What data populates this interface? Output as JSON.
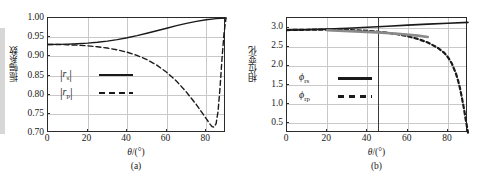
{
  "figure": {
    "panels": [
      {
        "id": "a",
        "caption": "(a)",
        "xlabel_symbol": "θ",
        "xlabel_unit": "/(°)",
        "ylabel": "振幅系数",
        "legend": [
          {
            "key": "|r",
            "sub": "s",
            "key_end": "|",
            "style": "solid",
            "name": "rs"
          },
          {
            "key": "|r",
            "sub": "p",
            "key_end": "|",
            "style": "dashed",
            "name": "rp"
          }
        ]
      },
      {
        "id": "b",
        "caption": "(b)",
        "xlabel_symbol": "θ",
        "xlabel_unit": "/(°)",
        "ylabel": "相位变化",
        "legend": [
          {
            "key": "ϕ",
            "sub": "rs",
            "key_end": "",
            "style": "solid",
            "name": "phi-rs"
          },
          {
            "key": "ϕ",
            "sub": "rp",
            "key_end": "",
            "style": "dashed",
            "name": "phi-rp"
          }
        ]
      }
    ]
  },
  "chart_data": [
    {
      "type": "line",
      "panel": "a",
      "title": "",
      "xlabel": "θ/(°)",
      "ylabel": "振幅系数",
      "xlim": [
        0,
        90
      ],
      "ylim": [
        0.7,
        1.0
      ],
      "xticks": [
        0,
        20,
        40,
        60,
        80
      ],
      "yticks": [
        0.7,
        0.75,
        0.8,
        0.85,
        0.9,
        0.95,
        1.0
      ],
      "ytick_labels": [
        "0.70",
        "0.75",
        "0.80",
        "0.85",
        "0.90",
        "0.95",
        "1.00"
      ],
      "xtick_labels": [
        "0",
        "20",
        "40",
        "60",
        "80"
      ],
      "grid": true,
      "legend_position": "center-left",
      "series": [
        {
          "name": "|r_s|",
          "style": "solid",
          "color": "#1a1a1a",
          "x": [
            0,
            5,
            10,
            15,
            20,
            25,
            30,
            35,
            40,
            45,
            50,
            55,
            60,
            65,
            70,
            75,
            80,
            85,
            90
          ],
          "y": [
            0.931,
            0.9312,
            0.9318,
            0.9329,
            0.9345,
            0.9368,
            0.9398,
            0.9437,
            0.9484,
            0.9539,
            0.9601,
            0.9667,
            0.9734,
            0.98,
            0.986,
            0.9912,
            0.9953,
            0.9984,
            1.0
          ]
        },
        {
          "name": "|r_p|",
          "style": "dashed",
          "color": "#1a1a1a",
          "x": [
            0,
            5,
            10,
            15,
            20,
            25,
            30,
            35,
            40,
            45,
            50,
            55,
            60,
            65,
            70,
            75,
            80,
            82,
            83,
            84,
            85,
            86,
            87,
            88,
            89,
            90
          ],
          "y": [
            0.931,
            0.9308,
            0.9302,
            0.9291,
            0.9274,
            0.925,
            0.9216,
            0.917,
            0.9108,
            0.9024,
            0.8914,
            0.877,
            0.8585,
            0.8352,
            0.8065,
            0.7742,
            0.7375,
            0.7225,
            0.7165,
            0.7155,
            0.7245,
            0.757,
            0.82,
            0.895,
            0.96,
            1.0
          ]
        }
      ]
    },
    {
      "type": "line",
      "panel": "b",
      "title": "",
      "xlabel": "θ/(°)",
      "ylabel": "相位变化",
      "xlim": [
        0,
        90
      ],
      "ylim": [
        0.25,
        3.25
      ],
      "xticks": [
        0,
        20,
        40,
        60,
        80
      ],
      "yticks": [
        0.5,
        1.0,
        1.5,
        2.0,
        2.5,
        3.0
      ],
      "ytick_labels": [
        "0.5",
        "1.0",
        "1.5",
        "2.0",
        "2.5",
        "3.0"
      ],
      "xtick_labels": [
        "0",
        "20",
        "40",
        "60",
        "80"
      ],
      "grid": true,
      "legend_position": "center-left",
      "marker_vertical_line_x": 45,
      "series": [
        {
          "name": "ϕ_rs",
          "style": "solid",
          "color": "#1a1a1a",
          "x": [
            0,
            10,
            20,
            30,
            40,
            50,
            60,
            70,
            80,
            90
          ],
          "y": [
            2.935,
            2.945,
            2.96,
            2.982,
            3.008,
            3.035,
            3.063,
            3.09,
            3.113,
            3.135
          ]
        },
        {
          "name": "ϕ_rp",
          "style": "dashed",
          "color": "#1a1a1a",
          "x": [
            0,
            10,
            20,
            30,
            40,
            50,
            55,
            60,
            65,
            70,
            75,
            78,
            80,
            82,
            84,
            85,
            86,
            87,
            88,
            89,
            90
          ],
          "y": [
            2.935,
            2.944,
            2.948,
            2.938,
            2.915,
            2.865,
            2.826,
            2.775,
            2.705,
            2.61,
            2.47,
            2.35,
            2.23,
            2.06,
            1.8,
            1.63,
            1.42,
            1.16,
            0.88,
            0.56,
            0.26
          ]
        },
        {
          "name": "ϕ_rs_overlay_gray",
          "style": "solid-gray",
          "color": "#8a8a8a",
          "x": [
            20,
            45,
            55,
            65,
            70
          ],
          "y": [
            2.93,
            2.875,
            2.84,
            2.79,
            2.755
          ]
        }
      ]
    }
  ]
}
